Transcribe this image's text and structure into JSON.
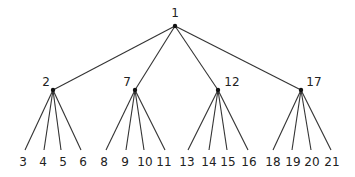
{
  "diagram": {
    "type": "tree",
    "line_color": "#333333",
    "node_color": "#111111",
    "root": {
      "id": "1",
      "x": 175,
      "y": 26,
      "label_x": 175,
      "label_y": 13
    },
    "internal": [
      {
        "id": "2",
        "x": 53,
        "y": 90,
        "label_x": 46,
        "label_y": 82
      },
      {
        "id": "7",
        "x": 135,
        "y": 90,
        "label_x": 127,
        "label_y": 82
      },
      {
        "id": "12",
        "x": 218,
        "y": 90,
        "label_x": 232,
        "label_y": 82
      },
      {
        "id": "17",
        "x": 301,
        "y": 90,
        "label_x": 314,
        "label_y": 82
      }
    ],
    "leaves": [
      {
        "id": "3",
        "parent": 0,
        "x": 25,
        "label_x": 23
      },
      {
        "id": "4",
        "parent": 0,
        "x": 44,
        "label_x": 43
      },
      {
        "id": "5",
        "parent": 0,
        "x": 61,
        "label_x": 63
      },
      {
        "id": "6",
        "parent": 0,
        "x": 81,
        "label_x": 83
      },
      {
        "id": "8",
        "parent": 1,
        "x": 106,
        "label_x": 104
      },
      {
        "id": "9",
        "parent": 1,
        "x": 126,
        "label_x": 125
      },
      {
        "id": "10",
        "parent": 1,
        "x": 144,
        "label_x": 145
      },
      {
        "id": "11",
        "parent": 1,
        "x": 165,
        "label_x": 164
      },
      {
        "id": "13",
        "parent": 2,
        "x": 188,
        "label_x": 187
      },
      {
        "id": "14",
        "parent": 2,
        "x": 209,
        "label_x": 209
      },
      {
        "id": "15",
        "parent": 2,
        "x": 227,
        "label_x": 228
      },
      {
        "id": "16",
        "parent": 2,
        "x": 248,
        "label_x": 249
      },
      {
        "id": "18",
        "parent": 3,
        "x": 273,
        "label_x": 273
      },
      {
        "id": "19",
        "parent": 3,
        "x": 292,
        "label_x": 293
      },
      {
        "id": "20",
        "parent": 3,
        "x": 311,
        "label_x": 312
      },
      {
        "id": "21",
        "parent": 3,
        "x": 331,
        "label_x": 332
      }
    ],
    "leaf_line_end_y": 150,
    "leaf_label_y": 162
  }
}
